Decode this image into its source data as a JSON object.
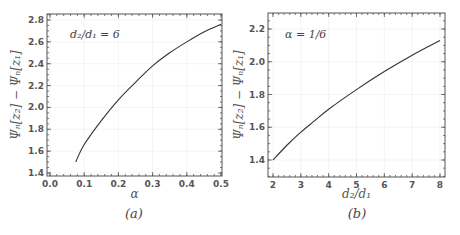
{
  "chart_data": [
    {
      "type": "line",
      "panel": "a",
      "caption": "(a)",
      "annotation": "d₂/d₁ = 6",
      "xlabel": "α",
      "ylabel": "Ψₙ[z₂] − Ψₙ[z₁]",
      "xlim": [
        0.0,
        0.5
      ],
      "ylim": [
        1.4,
        2.8
      ],
      "xticks": [
        "0.0",
        "0.1",
        "0.2",
        "0.3",
        "0.4",
        "0.5"
      ],
      "yticks": [
        "1.4",
        "1.6",
        "1.8",
        "2.0",
        "2.2",
        "2.4",
        "2.6",
        "2.8"
      ],
      "grid": true,
      "series": [
        {
          "name": "d2/d1 = 6",
          "x": [
            0.075,
            0.1,
            0.15,
            0.2,
            0.25,
            0.3,
            0.35,
            0.4,
            0.45,
            0.5
          ],
          "y": [
            1.5,
            1.66,
            1.88,
            2.07,
            2.23,
            2.38,
            2.5,
            2.6,
            2.69,
            2.76
          ]
        }
      ]
    },
    {
      "type": "line",
      "panel": "b",
      "caption": "(b)",
      "annotation": "α = 1/6",
      "xlabel": "d₂/d₁",
      "ylabel": "Ψₙ[z₂] − Ψₙ[z₁]",
      "xlim": [
        2,
        8
      ],
      "ylim": [
        1.3,
        2.3
      ],
      "xticks": [
        "2",
        "3",
        "4",
        "5",
        "6",
        "7",
        "8"
      ],
      "yticks": [
        "1.4",
        "1.6",
        "1.8",
        "2.0",
        "2.2"
      ],
      "grid": true,
      "series": [
        {
          "name": "alpha = 1/6",
          "x": [
            2,
            2.5,
            3,
            3.5,
            4,
            5,
            6,
            7,
            8
          ],
          "y": [
            1.4,
            1.49,
            1.57,
            1.64,
            1.71,
            1.83,
            1.94,
            2.04,
            2.13
          ]
        }
      ]
    }
  ]
}
